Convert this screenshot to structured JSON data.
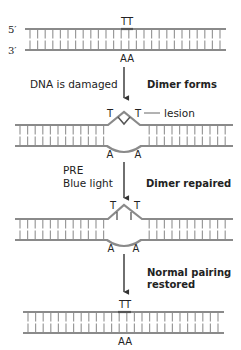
{
  "diagram": {
    "colors": {
      "strand": "#8a8a8a",
      "rung": "#9a9a9a",
      "arrow": "#333333",
      "text": "#222222",
      "background": "#ffffff"
    },
    "panel1": {
      "end_top": "5′",
      "end_bottom": "3′",
      "top_bases": "TT",
      "bottom_bases": "AA"
    },
    "step1": {
      "left_label": "DNA is damaged",
      "right_label": "Dimer forms"
    },
    "panel2": {
      "top_base_left": "T",
      "top_base_right": "T",
      "bottom_base_left": "A",
      "bottom_base_right": "A",
      "callout": "lesion"
    },
    "step2": {
      "left_label_line1": "PRE",
      "left_label_line2": "Blue light",
      "right_label": "Dimer repaired"
    },
    "panel3": {
      "top_base_left": "T",
      "top_base_right": "T",
      "bottom_base_left": "A",
      "bottom_base_right": "A"
    },
    "step3": {
      "right_label_line1": "Normal pairing",
      "right_label_line2": "restored"
    },
    "panel4": {
      "top_bases": "TT",
      "bottom_bases": "AA"
    }
  }
}
